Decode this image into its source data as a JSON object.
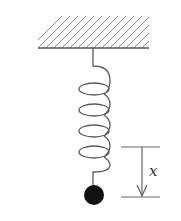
{
  "diagram": {
    "title": "",
    "type": "spring-mass system",
    "elements": {
      "ceiling": {
        "label": "",
        "description": "hatched fixed support"
      },
      "spring": {
        "label": "",
        "coils": 4
      },
      "mass": {
        "label": "",
        "description": "solid black ball"
      },
      "displacement": {
        "label": "x",
        "direction": "down"
      }
    }
  },
  "colors": {
    "line": "#5a5a5a",
    "hatch": "#8a8a8a",
    "mass": "#111111",
    "background": "#ffffff"
  }
}
